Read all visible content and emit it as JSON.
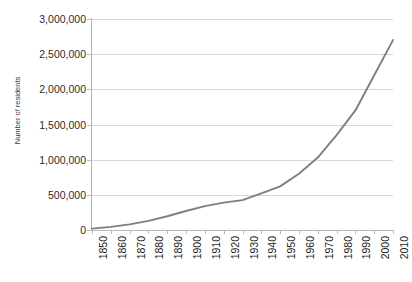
{
  "chart_data": {
    "type": "line",
    "title": "",
    "xlabel": "",
    "ylabel": "Number of residents",
    "x": [
      1850,
      1860,
      1870,
      1880,
      1890,
      1900,
      1910,
      1920,
      1930,
      1940,
      1950,
      1960,
      1970,
      1980,
      1990,
      2000,
      2010
    ],
    "values": [
      20000,
      45000,
      80000,
      130000,
      195000,
      270000,
      340000,
      390000,
      425000,
      520000,
      620000,
      800000,
      1030000,
      1350000,
      1700000,
      2200000,
      2700000
    ],
    "series": [
      {
        "name": "Number of residents",
        "color": "#7f7f7f",
        "values": [
          20000,
          45000,
          80000,
          130000,
          195000,
          270000,
          340000,
          390000,
          425000,
          520000,
          620000,
          800000,
          1030000,
          1350000,
          1700000,
          2200000,
          2700000
        ]
      }
    ],
    "x_tick_labels": [
      "1850",
      "1860",
      "1870",
      "1880",
      "1890",
      "1900",
      "1910",
      "1920",
      "1930",
      "1940",
      "1950",
      "1960",
      "1970",
      "1980",
      "1990",
      "2000",
      "2010"
    ],
    "y_tick_labels": [
      "0",
      "500,000",
      "1,000,000",
      "1,500,000",
      "2,000,000",
      "2,500,000",
      "3,000,000"
    ],
    "y_tick_values": [
      0,
      500000,
      1000000,
      1500000,
      2000000,
      2500000,
      3000000
    ],
    "ylim": [
      0,
      3000000
    ],
    "xlim": [
      1850,
      2010
    ],
    "grid": "horizontal",
    "legend": "none",
    "line_color": "#7f7f7f",
    "gridline_color": "#d9d9d9",
    "axis_color": "#b9b9b9"
  }
}
